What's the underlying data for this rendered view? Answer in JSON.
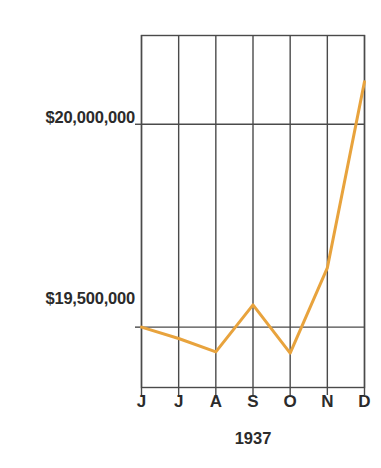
{
  "chart_data": {
    "type": "line",
    "title": "",
    "subtitle": "",
    "xlabel": "1937",
    "ylabel": "",
    "categories": [
      "J",
      "J",
      "A",
      "S",
      "O",
      "N",
      "D"
    ],
    "category_full_names": [
      "June",
      "July",
      "August",
      "September",
      "October",
      "November",
      "December"
    ],
    "series": [
      {
        "name": "",
        "values": [
          19500000,
          19472000,
          19439000,
          19555000,
          19436000,
          19646000,
          20105000
        ],
        "color": "#E8A33D"
      }
    ],
    "ylim": [
      19350000,
      20220000
    ],
    "yticks": [
      19500000,
      20000000
    ],
    "ytick_labels": [
      "$19,500,000",
      "$20,000,000"
    ],
    "grid": true,
    "grid_color": "#4a4a4a",
    "legend": null,
    "legend_position": "none",
    "annotations": []
  },
  "axes": {
    "y_ticks": [
      {
        "label": "$20,000,000",
        "value": 20000000
      },
      {
        "label": "$19,500,000",
        "value": 19500000
      }
    ],
    "x_ticks": [
      {
        "label": "J"
      },
      {
        "label": "J"
      },
      {
        "label": "A"
      },
      {
        "label": "S"
      },
      {
        "label": "O"
      },
      {
        "label": "N"
      },
      {
        "label": "D"
      }
    ],
    "x_axis_caption": "1937"
  },
  "style": {
    "line_color": "#E8A33D",
    "grid_color": "#4a4a4a",
    "text_color": "#2b2b2b",
    "background": "#ffffff"
  }
}
